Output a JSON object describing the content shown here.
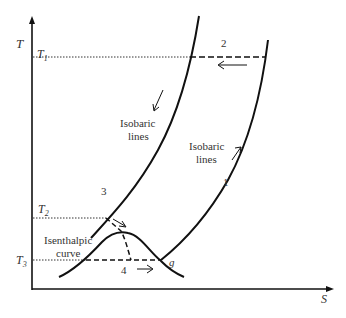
{
  "diagram": {
    "type": "T-S diagram (refrigeration / liquefaction cycle)",
    "axes": {
      "y_label": "T",
      "x_label": "S"
    },
    "temperature_levels": [
      {
        "label": "T",
        "sub": "1"
      },
      {
        "label": "T",
        "sub": "2"
      },
      {
        "label": "T",
        "sub": "3"
      }
    ],
    "curve_labels": {
      "isobaric_left_line1": "Isobaric",
      "isobaric_left_line2": "lines",
      "isobaric_right_line1": "Isobaric",
      "isobaric_right_line2": "lines",
      "isenthalpic_line1": "Isenthalpic",
      "isenthalpic_line2": "curve"
    },
    "process_labels": {
      "p1": "1",
      "p2": "2",
      "p3": "3",
      "p4": "4",
      "point_g": "g"
    },
    "colors": {
      "line": "#111111",
      "text": "#333333",
      "background": "#ffffff"
    }
  }
}
